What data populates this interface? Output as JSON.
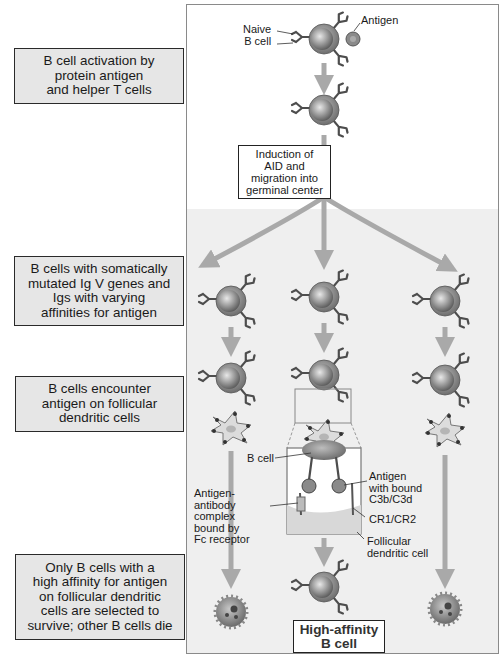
{
  "left_labels": [
    {
      "id": "activation",
      "text": "B cell activation by\nprotein antigen\nand helper T cells"
    },
    {
      "id": "mutation",
      "text": "B cells with somatically\nmutated Ig V genes and\nIgs with varying\naffinities for antigen"
    },
    {
      "id": "encounter",
      "text": "B cells encounter\nantigen on follicular\ndendritic cells"
    },
    {
      "id": "selection",
      "text": "Only B cells with a\nhigh affinity for antigen\non follicular dendritic\ncells are selected to\nsurvive; other B cells die"
    }
  ],
  "annotations": {
    "naive_b_cell": "Naive\nB cell",
    "antigen": "Antigen",
    "b_cell": "B cell",
    "antigen_bound": "Antigen\nwith bound\nC3b/C3d",
    "ag_ab_complex": "Antigen-\nantibody\ncomplex\nbound by\nFc receptor",
    "cr1_cr2": "CR1/CR2",
    "fdc": "Follicular\ndendritic cell"
  },
  "step_box": "Induction of\nAID and\nmigration into\ngerminal center",
  "result_box": "High-affinity\nB cell",
  "colors": {
    "label_fill": "#e6e6e6",
    "panel_shade": "#efefef",
    "arrow": "#a9a9a9",
    "cell_outer": "#8f8f8f",
    "cell_nucleus": "#9c9c9c",
    "antibody": "#555555",
    "fdc_fill": "#d9d9d9"
  }
}
